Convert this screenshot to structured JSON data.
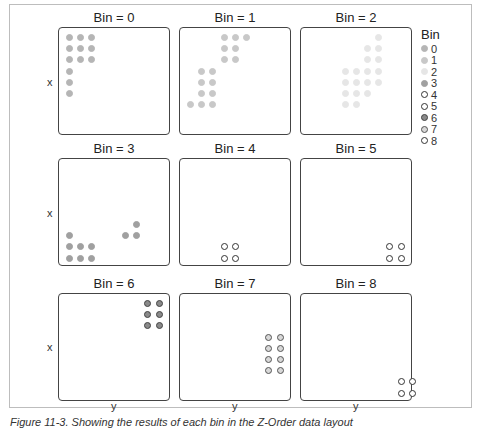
{
  "chart_data": {
    "type": "scatter",
    "title": "",
    "layout": "facet grid 3x3",
    "xlabel": "y",
    "ylabel": "x",
    "legend": {
      "title": "Bin",
      "position": "right",
      "entries": [
        {
          "label": "0",
          "style": "filled",
          "fill": "#b5b5b5",
          "stroke": "#b5b5b5"
        },
        {
          "label": "1",
          "style": "filled",
          "fill": "#c8c8c8",
          "stroke": "#c8c8c8"
        },
        {
          "label": "2",
          "style": "filled",
          "fill": "#e6e6e6",
          "stroke": "#e6e6e6"
        },
        {
          "label": "3",
          "style": "filled",
          "fill": "#a0a0a0",
          "stroke": "#a0a0a0"
        },
        {
          "label": "4",
          "style": "open",
          "fill": "#ffffff",
          "stroke": "#333333"
        },
        {
          "label": "5",
          "style": "open",
          "fill": "#ffffff",
          "stroke": "#333333"
        },
        {
          "label": "6",
          "style": "filled",
          "fill": "#8a8a8a",
          "stroke": "#444444"
        },
        {
          "label": "7",
          "style": "open",
          "fill": "#d8d8d8",
          "stroke": "#555555"
        },
        {
          "label": "8",
          "style": "open",
          "fill": "#ffffff",
          "stroke": "#333333"
        }
      ]
    },
    "panels": [
      {
        "title": "Bin = 0",
        "bin": 0,
        "points": [
          [
            0,
            0
          ],
          [
            1,
            0
          ],
          [
            2,
            0
          ],
          [
            0,
            1
          ],
          [
            1,
            1
          ],
          [
            2,
            1
          ],
          [
            0,
            2
          ],
          [
            1,
            2
          ],
          [
            2,
            2
          ],
          [
            0,
            3
          ],
          [
            0,
            4
          ],
          [
            0,
            5
          ]
        ]
      },
      {
        "title": "Bin = 1",
        "bin": 1,
        "points": [
          [
            3,
            0
          ],
          [
            4,
            0
          ],
          [
            5,
            0
          ],
          [
            3,
            1
          ],
          [
            4,
            1
          ],
          [
            3,
            2
          ],
          [
            4,
            2
          ],
          [
            1,
            3
          ],
          [
            2,
            3
          ],
          [
            1,
            4
          ],
          [
            2,
            4
          ],
          [
            1,
            5
          ],
          [
            2,
            5
          ],
          [
            0,
            6
          ],
          [
            1,
            6
          ],
          [
            2,
            6
          ]
        ]
      },
      {
        "title": "Bin = 2",
        "bin": 2,
        "points": [
          [
            6,
            0
          ],
          [
            5,
            1
          ],
          [
            6,
            1
          ],
          [
            5,
            2
          ],
          [
            6,
            2
          ],
          [
            3,
            3
          ],
          [
            4,
            3
          ],
          [
            5,
            3
          ],
          [
            6,
            3
          ],
          [
            3,
            4
          ],
          [
            4,
            4
          ],
          [
            5,
            4
          ],
          [
            6,
            4
          ],
          [
            3,
            5
          ],
          [
            4,
            5
          ],
          [
            5,
            5
          ],
          [
            3,
            6
          ],
          [
            4,
            6
          ]
        ]
      },
      {
        "title": "Bin = 3",
        "bin": 3,
        "points": [
          [
            6,
            5
          ],
          [
            5,
            6
          ],
          [
            6,
            6
          ],
          [
            0,
            6
          ],
          [
            0,
            7
          ],
          [
            1,
            7
          ],
          [
            2,
            7
          ],
          [
            0,
            8
          ],
          [
            1,
            8
          ],
          [
            2,
            8
          ]
        ]
      },
      {
        "title": "Bin = 4",
        "bin": 4,
        "points": [
          [
            3,
            7
          ],
          [
            4,
            7
          ],
          [
            3,
            8
          ],
          [
            4,
            8
          ]
        ]
      },
      {
        "title": "Bin = 5",
        "bin": 5,
        "points": [
          [
            7,
            7
          ],
          [
            8,
            7
          ],
          [
            7,
            8
          ],
          [
            8,
            8
          ]
        ]
      },
      {
        "title": "Bin = 6",
        "bin": 6,
        "points": [
          [
            7,
            0
          ],
          [
            8,
            0
          ],
          [
            7,
            1
          ],
          [
            8,
            1
          ],
          [
            7,
            2
          ],
          [
            8,
            2
          ]
        ]
      },
      {
        "title": "Bin = 7",
        "bin": 7,
        "points": [
          [
            7,
            3
          ],
          [
            8,
            3
          ],
          [
            7,
            4
          ],
          [
            8,
            4
          ],
          [
            7,
            5
          ],
          [
            8,
            5
          ],
          [
            7,
            6
          ],
          [
            8,
            6
          ]
        ]
      },
      {
        "title": "Bin = 8",
        "bin": 8,
        "points": [
          [
            8,
            7
          ],
          [
            9,
            7
          ],
          [
            8,
            8
          ],
          [
            9,
            8
          ]
        ]
      }
    ],
    "point_coords_note": "grid positions [col,row] within each panel, row 0 at top",
    "grid": false
  },
  "axis": {
    "y_label": "x",
    "x_label": "y"
  },
  "caption": "Figure 11-3. Showing the results of each bin in the Z-Order data layout"
}
